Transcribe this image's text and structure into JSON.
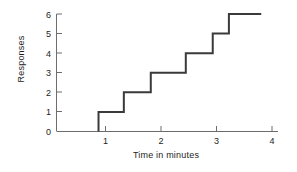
{
  "chart_data": {
    "type": "line",
    "title": "",
    "subtitle": "",
    "xlabel": "Time in minutes",
    "ylabel": "Responses",
    "xlim": [
      0,
      4
    ],
    "ylim": [
      0,
      6
    ],
    "xticks": [
      1,
      2,
      3,
      4
    ],
    "xtick_labels": [
      "1",
      "2",
      "3",
      "4"
    ],
    "yticks": [
      0,
      1,
      2,
      3,
      4,
      5,
      6
    ],
    "ytick_labels": [
      "0",
      "1",
      "2",
      "3",
      "4",
      "5",
      "6"
    ],
    "grid": false,
    "legend": null,
    "line_color": "#3a3a3a",
    "line_width": 2,
    "drawstyle": "steps-post",
    "series": [
      {
        "name": "Cumulative responses",
        "x": [
          0.78,
          0.78,
          1.25,
          1.25,
          1.75,
          1.75,
          2.4,
          2.4,
          2.9,
          2.9,
          3.2,
          3.2,
          3.8
        ],
        "y": [
          0,
          1,
          1,
          2,
          2,
          3,
          3,
          4,
          4,
          5,
          5,
          6,
          6
        ]
      }
    ],
    "response_times": [
      0.78,
      1.25,
      1.75,
      2.4,
      2.9,
      3.2
    ],
    "cumulative_counts": [
      1,
      2,
      3,
      4,
      5,
      6
    ]
  },
  "axes": {
    "x_title": "Time in minutes",
    "y_title": "Responses"
  }
}
